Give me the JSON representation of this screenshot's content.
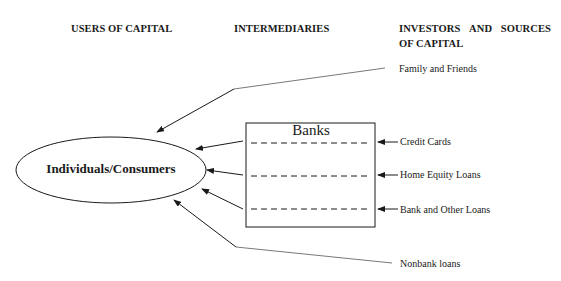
{
  "headers": {
    "users": "USERS OF CAPITAL",
    "intermediaries": "INTERMEDIARIES",
    "investors_line1": [
      "INVESTORS",
      "AND",
      "SOURCES"
    ],
    "investors_line2": "OF CAPITAL"
  },
  "nodes": {
    "consumer": "Individuals/Consumers",
    "banks": "Banks"
  },
  "sources": {
    "family": "Family and Friends",
    "credit_cards": "Credit Cards",
    "home_equity": "Home Equity Loans",
    "bank_other": "Bank and Other Loans",
    "nonbank": "Nonbank loans"
  },
  "colors": {
    "line": "#1a1a1a",
    "thin_line": "#555555",
    "background": "#ffffff"
  }
}
